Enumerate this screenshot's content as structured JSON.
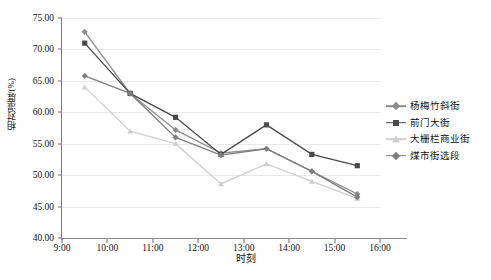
{
  "chart_data": {
    "type": "line",
    "title": "",
    "xlabel": "时刻",
    "ylabel": "相对湿度/(%)",
    "xlim": [
      "9:00",
      "16:00"
    ],
    "ylim": [
      40.0,
      75.0
    ],
    "ytick_step": 5.0,
    "grid": true,
    "legend_position": "right",
    "x": [
      "9:30",
      "10:30",
      "11:30",
      "12:30",
      "13:30",
      "14:30",
      "15:30"
    ],
    "xticks": [
      "9:00",
      "10:00",
      "11:00",
      "12:00",
      "13:00",
      "14:00",
      "15:00",
      "16:00"
    ],
    "yticks": [
      "40.00",
      "45.00",
      "50.00",
      "55.00",
      "60.00",
      "65.00",
      "70.00",
      "75.00"
    ],
    "series": [
      {
        "name": "杨梅竹斜街",
        "color": "#8c8c8c",
        "marker": "diamond",
        "values": [
          72.8,
          63.0,
          57.2,
          53.5,
          54.2,
          50.6,
          47.0
        ]
      },
      {
        "name": "前门大街",
        "color": "#4a4a4a",
        "marker": "square",
        "values": [
          71.0,
          63.0,
          59.2,
          53.3,
          58.0,
          53.3,
          51.5
        ]
      },
      {
        "name": "大栅栏商业街",
        "color": "#cfcfcf",
        "marker": "triangle",
        "values": [
          64.0,
          57.0,
          55.0,
          48.6,
          51.8,
          49.0,
          46.3
        ]
      },
      {
        "name": "煤市街选段",
        "color": "#7f7f7f",
        "marker": "diamond",
        "values": [
          65.8,
          63.0,
          56.0,
          53.2,
          54.2,
          50.6,
          46.5
        ]
      }
    ]
  }
}
